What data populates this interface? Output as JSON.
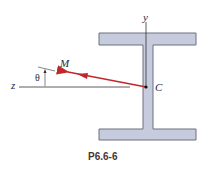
{
  "figure": {
    "caption": "P6.6-6",
    "labels": {
      "y_axis": "y",
      "z_axis": "z",
      "moment": "M",
      "angle": "θ",
      "centroid": "C"
    },
    "colors": {
      "section_fill": "#c6cbde",
      "section_stroke": "#6d7080",
      "moment_arrow": "#c0282c",
      "axis_line": "#333333"
    }
  }
}
